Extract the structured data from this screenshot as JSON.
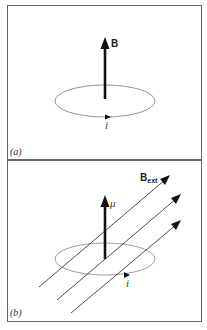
{
  "figure": {
    "panels": [
      {
        "id": "a",
        "label": "(a)",
        "vector_label": "B",
        "current_label": "i"
      },
      {
        "id": "b",
        "label": "(b)",
        "moment_label": "μ",
        "field_label_main": "B",
        "field_label_sub": "ext",
        "current_label": "i"
      }
    ],
    "colors": {
      "border": "#555555",
      "loop": "#777777",
      "arrow": "#111111"
    }
  }
}
